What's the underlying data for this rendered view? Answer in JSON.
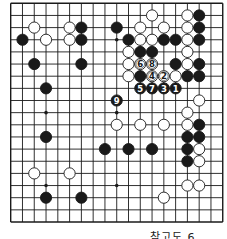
{
  "diagram": {
    "type": "go-board",
    "size": 19,
    "colors": {
      "line": "#1a1a1a",
      "black_stone": "#1a1a1a",
      "white_stone": "#ffffff",
      "background": "#ffffff"
    },
    "hoshi": [
      [
        3,
        3
      ],
      [
        9,
        3
      ],
      [
        15,
        3
      ],
      [
        3,
        9
      ],
      [
        9,
        9
      ],
      [
        15,
        9
      ],
      [
        3,
        15
      ],
      [
        9,
        15
      ],
      [
        15,
        15
      ]
    ],
    "stones": [
      {
        "c": 12,
        "r": 1,
        "color": "W"
      },
      {
        "c": 15,
        "r": 1,
        "color": "W"
      },
      {
        "c": 16,
        "r": 1,
        "color": "B"
      },
      {
        "c": 2,
        "r": 2,
        "color": "W"
      },
      {
        "c": 5,
        "r": 2,
        "color": "W"
      },
      {
        "c": 6,
        "r": 2,
        "color": "B"
      },
      {
        "c": 9,
        "r": 2,
        "color": "B"
      },
      {
        "c": 11,
        "r": 2,
        "color": "W"
      },
      {
        "c": 13,
        "r": 2,
        "color": "W"
      },
      {
        "c": 15,
        "r": 2,
        "color": "W"
      },
      {
        "c": 16,
        "r": 2,
        "color": "B"
      },
      {
        "c": 1,
        "r": 3,
        "color": "B"
      },
      {
        "c": 3,
        "r": 3,
        "color": "W"
      },
      {
        "c": 5,
        "r": 3,
        "color": "W"
      },
      {
        "c": 6,
        "r": 3,
        "color": "B"
      },
      {
        "c": 10,
        "r": 3,
        "color": "B"
      },
      {
        "c": 11,
        "r": 3,
        "color": "W"
      },
      {
        "c": 12,
        "r": 3,
        "color": "W"
      },
      {
        "c": 13,
        "r": 3,
        "color": "B"
      },
      {
        "c": 14,
        "r": 3,
        "color": "B"
      },
      {
        "c": 15,
        "r": 3,
        "color": "W"
      },
      {
        "c": 16,
        "r": 3,
        "color": "B"
      },
      {
        "c": 10,
        "r": 4,
        "color": "W"
      },
      {
        "c": 11,
        "r": 4,
        "color": "B"
      },
      {
        "c": 12,
        "r": 4,
        "color": "B"
      },
      {
        "c": 15,
        "r": 4,
        "color": "W"
      },
      {
        "c": 2,
        "r": 5,
        "color": "B"
      },
      {
        "c": 6,
        "r": 5,
        "color": "B"
      },
      {
        "c": 10,
        "r": 5,
        "color": "W"
      },
      {
        "c": 11,
        "r": 5,
        "color": "W",
        "label": "6"
      },
      {
        "c": 12,
        "r": 5,
        "color": "W",
        "label": "8"
      },
      {
        "c": 14,
        "r": 5,
        "color": "B"
      },
      {
        "c": 15,
        "r": 5,
        "color": "W"
      },
      {
        "c": 16,
        "r": 5,
        "color": "B"
      },
      {
        "c": 10,
        "r": 6,
        "color": "W"
      },
      {
        "c": 11,
        "r": 6,
        "color": "B"
      },
      {
        "c": 12,
        "r": 6,
        "color": "W",
        "label": "4"
      },
      {
        "c": 13,
        "r": 6,
        "color": "W",
        "label": "2"
      },
      {
        "c": 14,
        "r": 6,
        "color": "W"
      },
      {
        "c": 15,
        "r": 6,
        "color": "B"
      },
      {
        "c": 16,
        "r": 6,
        "color": "B"
      },
      {
        "c": 3,
        "r": 7,
        "color": "B"
      },
      {
        "c": 11,
        "r": 7,
        "color": "B",
        "label": "5"
      },
      {
        "c": 12,
        "r": 7,
        "color": "B",
        "label": "7"
      },
      {
        "c": 13,
        "r": 7,
        "color": "B",
        "label": "3"
      },
      {
        "c": 14,
        "r": 7,
        "color": "B",
        "label": "1"
      },
      {
        "c": 9,
        "r": 8,
        "color": "B",
        "label": "9"
      },
      {
        "c": 16,
        "r": 8,
        "color": "W"
      },
      {
        "c": 15,
        "r": 9,
        "color": "W"
      },
      {
        "c": 9,
        "r": 10,
        "color": "W"
      },
      {
        "c": 11,
        "r": 10,
        "color": "W"
      },
      {
        "c": 13,
        "r": 10,
        "color": "W"
      },
      {
        "c": 15,
        "r": 10,
        "color": "W"
      },
      {
        "c": 16,
        "r": 10,
        "color": "B"
      },
      {
        "c": 3,
        "r": 11,
        "color": "B"
      },
      {
        "c": 15,
        "r": 11,
        "color": "B"
      },
      {
        "c": 16,
        "r": 11,
        "color": "B"
      },
      {
        "c": 8,
        "r": 12,
        "color": "B"
      },
      {
        "c": 10,
        "r": 12,
        "color": "B"
      },
      {
        "c": 12,
        "r": 12,
        "color": "B"
      },
      {
        "c": 15,
        "r": 12,
        "color": "B"
      },
      {
        "c": 16,
        "r": 12,
        "color": "W"
      },
      {
        "c": 15,
        "r": 13,
        "color": "B"
      },
      {
        "c": 16,
        "r": 13,
        "color": "W"
      },
      {
        "c": 2,
        "r": 14,
        "color": "W"
      },
      {
        "c": 5,
        "r": 14,
        "color": "W"
      },
      {
        "c": 15,
        "r": 15,
        "color": "W"
      },
      {
        "c": 16,
        "r": 15,
        "color": "W"
      },
      {
        "c": 3,
        "r": 16,
        "color": "B"
      },
      {
        "c": 6,
        "r": 16,
        "color": "B"
      },
      {
        "c": 13,
        "r": 16,
        "color": "W"
      }
    ]
  },
  "caption": "참고도 6"
}
